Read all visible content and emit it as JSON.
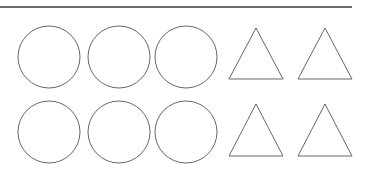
{
  "figure": {
    "title": "Shapes figure",
    "background_color": "#ffffff",
    "stroke_color": "#555555",
    "rule_color": "#3b3b3b",
    "width": 370,
    "height": 179
  },
  "divider": {
    "name": "horizontal-rule",
    "x1": 0,
    "y1": 7,
    "x2": 352,
    "y2": 7,
    "thickness": 1.6
  },
  "rows": [
    {
      "label": "row-1",
      "circles": [
        {
          "label": "circle-1",
          "cx": 49,
          "cy": 57,
          "r": 31
        },
        {
          "label": "circle-2",
          "cx": 119,
          "cy": 57,
          "r": 31
        },
        {
          "label": "circle-3",
          "cx": 186,
          "cy": 57,
          "r": 31
        }
      ],
      "triangles": [
        {
          "label": "triangle-1",
          "apex_x": 256,
          "apex_y": 28,
          "base_left_x": 229,
          "base_right_x": 283,
          "base_y": 79
        },
        {
          "label": "triangle-2",
          "apex_x": 325,
          "apex_y": 28,
          "base_left_x": 298,
          "base_right_x": 352,
          "base_y": 79
        }
      ]
    },
    {
      "label": "row-2",
      "circles": [
        {
          "label": "circle-4",
          "cx": 49,
          "cy": 132,
          "r": 31
        },
        {
          "label": "circle-5",
          "cx": 119,
          "cy": 132,
          "r": 31
        },
        {
          "label": "circle-6",
          "cx": 186,
          "cy": 132,
          "r": 31
        }
      ],
      "triangles": [
        {
          "label": "triangle-3",
          "apex_x": 256,
          "apex_y": 104,
          "base_left_x": 229,
          "base_right_x": 283,
          "base_y": 156
        },
        {
          "label": "triangle-4",
          "apex_x": 325,
          "apex_y": 104,
          "base_left_x": 298,
          "base_right_x": 352,
          "base_y": 156
        }
      ]
    }
  ],
  "chart_data": {
    "type": "table",
    "title": "Shapes figure",
    "xlabel": "",
    "ylabel": "",
    "categories": [
      "circle",
      "triangle"
    ],
    "series": [
      {
        "name": "row-1",
        "values": [
          3,
          2
        ]
      },
      {
        "name": "row-2",
        "values": [
          3,
          2
        ]
      }
    ],
    "totals": {
      "circle": 6,
      "triangle": 4,
      "all_shapes": 10
    }
  }
}
